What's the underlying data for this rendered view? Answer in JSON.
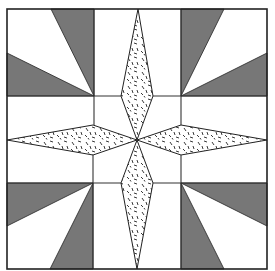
{
  "diagram": {
    "title": "",
    "type": "quilt-block",
    "colors": {
      "background": "#ffffff",
      "dark_fabric": "#777777",
      "speckled_fabric_base": "#ffffff",
      "speckle": "#222222",
      "outline": "#222222"
    },
    "grid": {
      "outer": {
        "x0": 7,
        "y0": 9,
        "x1": 267,
        "y1": 269
      },
      "cols": [
        7,
        94,
        181,
        267
      ],
      "rows": [
        9,
        96,
        183,
        269
      ]
    },
    "center": {
      "x": 137,
      "y": 140
    },
    "corner_blocks": [
      {
        "position": "top-left",
        "pivot": [
          94,
          96
        ],
        "wedges": [
          [
            [
              51,
              9
            ],
            [
              94,
              9
            ]
          ],
          [
            [
              7,
              53
            ],
            [
              7,
              96
            ]
          ]
        ]
      },
      {
        "position": "top-right",
        "pivot": [
          181,
          96
        ],
        "wedges": [
          [
            [
              181,
              9
            ],
            [
              224,
              9
            ]
          ],
          [
            [
              267,
              53
            ],
            [
              267,
              96
            ]
          ]
        ]
      },
      {
        "position": "bottom-left",
        "pivot": [
          93,
          183
        ],
        "wedges": [
          [
            [
              7,
              183
            ],
            [
              7,
              226
            ]
          ],
          [
            [
              50,
              269
            ],
            [
              93,
              269
            ]
          ]
        ]
      },
      {
        "position": "bottom-right",
        "pivot": [
          181,
          183
        ],
        "wedges": [
          [
            [
              267,
              183
            ],
            [
              267,
              226
            ]
          ],
          [
            [
              181,
              269
            ],
            [
              224,
              269
            ]
          ]
        ]
      }
    ],
    "diamonds": [
      {
        "position": "top",
        "points": [
          [
            138,
            9
          ],
          [
            153,
            96
          ],
          [
            137,
            140
          ],
          [
            121,
            96
          ]
        ]
      },
      {
        "position": "bottom",
        "points": [
          [
            137,
            140
          ],
          [
            153,
            183
          ],
          [
            137,
            269
          ],
          [
            121,
            183
          ]
        ]
      },
      {
        "position": "left",
        "points": [
          [
            7,
            140
          ],
          [
            93,
            125
          ],
          [
            137,
            140
          ],
          [
            93,
            155
          ]
        ]
      },
      {
        "position": "right",
        "points": [
          [
            137,
            140
          ],
          [
            181,
            125
          ],
          [
            267,
            140
          ],
          [
            181,
            155
          ]
        ]
      }
    ]
  }
}
